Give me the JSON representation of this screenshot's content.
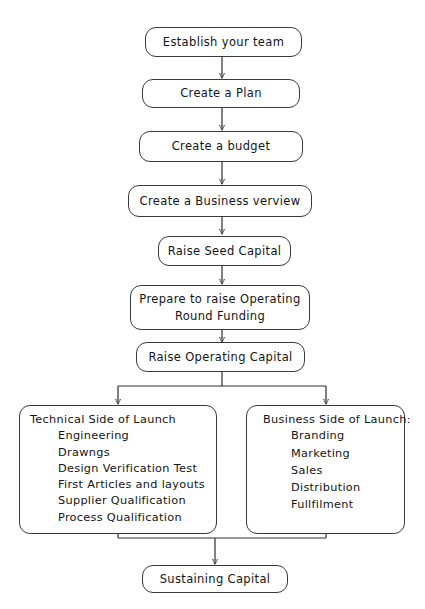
{
  "diagram": {
    "background_color": "#ffffff",
    "line_color": "#303030",
    "text_color": "#141414",
    "nodes": [
      {
        "id": "establish-team",
        "label": "Establish your team"
      },
      {
        "id": "create-plan",
        "label": "Create a Plan"
      },
      {
        "id": "create-budget",
        "label": "Create a budget"
      },
      {
        "id": "business-overview",
        "label": "Create a Business verview"
      },
      {
        "id": "raise-seed-capital",
        "label": "Raise Seed Capital"
      },
      {
        "id": "prepare-operating",
        "label_line1": "Prepare to raise Operating",
        "label_line2": "Round Funding"
      },
      {
        "id": "raise-operating",
        "label": "Raise Operating Capital"
      },
      {
        "id": "sustaining-capital",
        "label": "Sustaining Capital"
      }
    ],
    "technical_panel": {
      "title": "Technical Side of Launch",
      "items": [
        "Engineering",
        "Drawngs",
        "Design Verification Test",
        "First Articles and layouts",
        "Supplier Qualification",
        "Process Qualification"
      ]
    },
    "business_panel": {
      "title": "Business Side of Launch:",
      "items": [
        "Branding",
        "Marketing",
        "Sales",
        "Distribution",
        "Fullfilment"
      ]
    }
  }
}
